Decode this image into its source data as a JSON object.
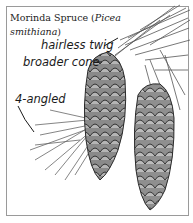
{
  "figure": {
    "title_plain": "Morinda Spruce (",
    "title_italic_1": "Picea",
    "title_italic_2": "smithiana",
    "title_close": ")",
    "labels": {
      "twig": "hairless twig",
      "cone": "broader cone",
      "needle": "4-angled"
    },
    "colors": {
      "border": "#9a9a9a",
      "cone_dark": "#3a3a3a",
      "cone_mid": "#7a7a7a",
      "needle": "#555555"
    }
  }
}
